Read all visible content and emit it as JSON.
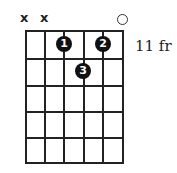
{
  "chord": {
    "strings": 6,
    "frets_shown": 5,
    "start_fret_label": "11 fr",
    "string_markers": [
      "x",
      "x",
      "",
      "",
      "",
      "o"
    ],
    "fingers": [
      {
        "label": "1",
        "string": 3,
        "fret": 1
      },
      {
        "label": "2",
        "string": 5,
        "fret": 1
      },
      {
        "label": "3",
        "string": 4,
        "fret": 2
      }
    ]
  }
}
